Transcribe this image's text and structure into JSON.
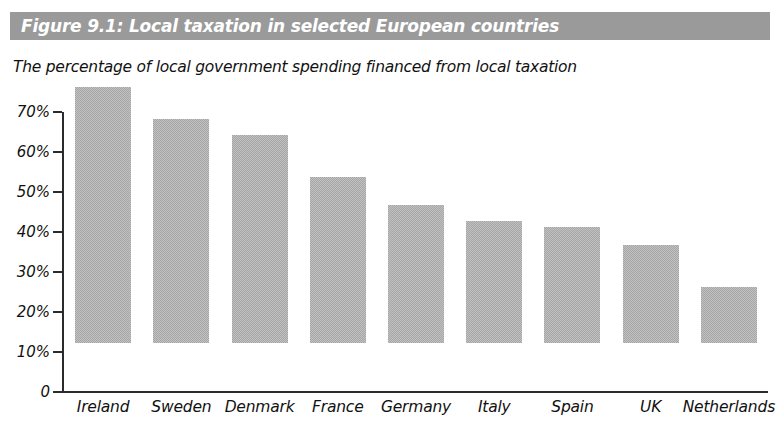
{
  "figure": {
    "banner_title": "Figure 9.1: Local taxation in selected European countries",
    "banner_color": "#9a9a9a",
    "banner_text_color": "#ffffff",
    "subtitle": "The percentage of local government spending financed from local taxation"
  },
  "chart_data": {
    "type": "bar",
    "title": "Figure 9.1: Local taxation in selected European countries",
    "subtitle": "The percentage of local government spending financed from local taxation",
    "xlabel": "",
    "ylabel": "",
    "ylim": [
      0,
      70
    ],
    "grid": false,
    "legend": "none",
    "bar_color": "#a6a6a6",
    "axis_color": "#2b2b2b",
    "yticks": [
      0,
      10,
      20,
      30,
      40,
      50,
      60,
      70
    ],
    "ytick_labels": [
      "0",
      "10%",
      "20%",
      "30%",
      "40%",
      "50%",
      "60%",
      "70%"
    ],
    "categories": [
      "Ireland",
      "Sweden",
      "Denmark",
      "France",
      "Germany",
      "Italy",
      "Spain",
      "UK",
      "Netherlands"
    ],
    "values": [
      64,
      56,
      52,
      41.5,
      34.5,
      30.5,
      29,
      24.5,
      14
    ],
    "series": [
      {
        "name": "Percentage of local government spending financed from local taxation",
        "values": [
          64,
          56,
          52,
          41.5,
          34.5,
          30.5,
          29,
          24.5,
          14
        ]
      }
    ]
  }
}
